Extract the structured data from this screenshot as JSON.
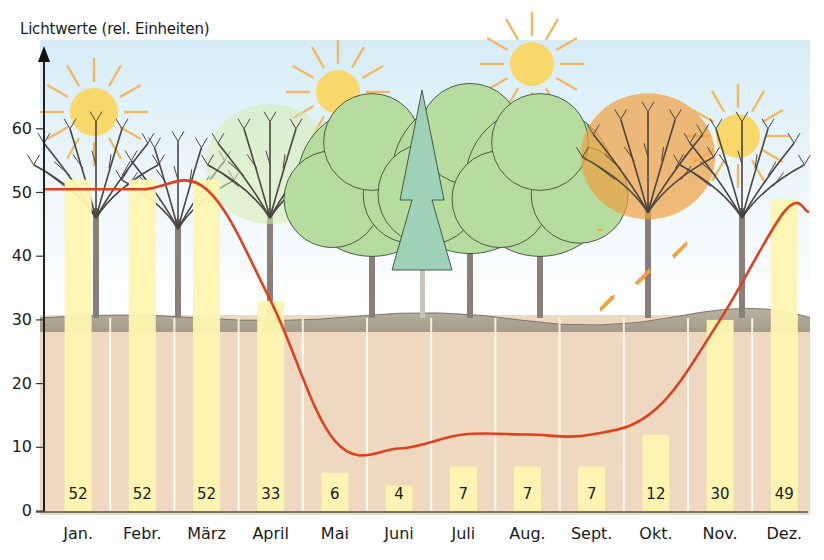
{
  "chart_data": {
    "type": "bar",
    "title": "",
    "ylabel": "Lichtwerte (rel. Einheiten)",
    "xlabel": "",
    "ylim": [
      0,
      65
    ],
    "yticks": [
      0,
      10,
      20,
      30,
      40,
      50,
      60
    ],
    "grid": false,
    "legend": null,
    "categories": [
      "Jan.",
      "Febr.",
      "März",
      "April",
      "Mai",
      "Juni",
      "Juli",
      "Aug.",
      "Sept.",
      "Okt.",
      "Nov.",
      "Dez."
    ],
    "series": [
      {
        "name": "Lichtwerte am Waldboden (Balken)",
        "type": "bar",
        "color": "#fdf6b0",
        "values": [
          52,
          52,
          52,
          33,
          6,
          4,
          7,
          7,
          7,
          12,
          30,
          49
        ]
      },
      {
        "name": "Lichtkurve",
        "type": "line",
        "color": "#e0401e",
        "values": [
          50.5,
          50.5,
          50.5,
          33,
          11,
          9.8,
          12,
          12,
          12,
          16,
          30,
          47
        ]
      }
    ],
    "annotations": {
      "sun_months": [
        "Jan.",
        "Mai",
        "Juli",
        "Nov."
      ],
      "illustration": "Laubwald im Jahresverlauf: kahle Bäume im Winter, Austrieb im April, volles Laub Mai–Sept., Herbstfärbung im Oktober, kahl im November/Dezember"
    }
  },
  "axis": {
    "y_title": "Lichtwerte (rel. Einheiten)",
    "y_ticks": [
      "0",
      "10",
      "20",
      "30",
      "40",
      "50",
      "60"
    ]
  },
  "colors": {
    "sky": "#dff0f8",
    "ground_top": "#a8a08e",
    "soil": "#eed8c0",
    "bar": "#fdf6b0",
    "curve": "#e0401e",
    "sun": "#fbd55a",
    "sun_rays": "#f0b860",
    "trunk": "#8a7e78",
    "leaf_green": "#b6dca0",
    "spruce": "#9fd0b8",
    "autumn": "#f0a040",
    "axis": "#222222"
  }
}
